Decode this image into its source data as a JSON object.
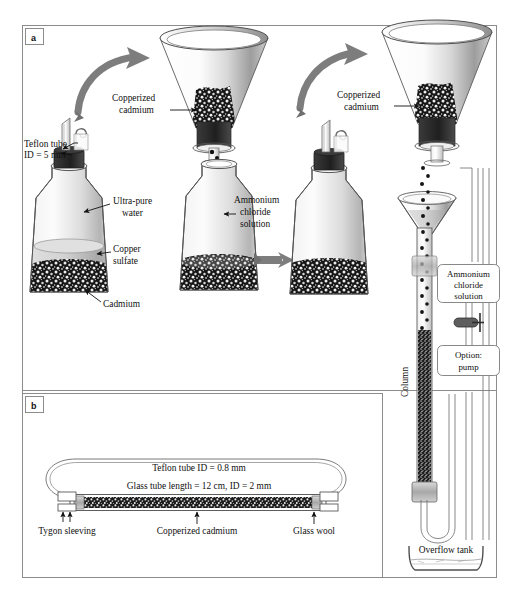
{
  "figure": {
    "title_fragment_top": "",
    "panels": [
      {
        "id": "a",
        "letter": "a"
      },
      {
        "id": "b",
        "letter": "b"
      }
    ]
  },
  "panel_a": {
    "letter": "a",
    "labels": {
      "teflon_tube": "Teflon tube",
      "teflon_tube_id": "ID = 5 mm",
      "copperized_cadmium_left": "Copperized",
      "copperized_cadmium_left2": "cadmium",
      "copperized_cadmium_right": "Copperized",
      "copperized_cadmium_right2": "cadmium",
      "ultra_pure_water": "Ultra-pure",
      "ultra_pure_water2": "water",
      "copper_sulfate": "Copper",
      "copper_sulfate2": "sulfate",
      "cadmium": "Cadmium",
      "ammonium_chloride": "Ammonium",
      "ammonium_chloride2": "chloride",
      "ammonium_chloride3": "solution",
      "column": "Column",
      "overflow_tank": "Overflow tank"
    },
    "callouts": [
      {
        "name": "ammonium-chloride-solution-callout",
        "lines": [
          "Ammonium",
          "chloride",
          "solution"
        ]
      },
      {
        "name": "option-pump-callout",
        "lines": [
          "Option:",
          "pump"
        ]
      }
    ]
  },
  "panel_b": {
    "letter": "b",
    "labels": {
      "teflon_tube_id": "Teflon tube ID = 0.8 mm",
      "glass_tube": "Glass tube length = 12 cm, ID = 2 mm",
      "tygon_sleeving": "Tygon sleeving",
      "copperized_cadmium": "Copperized cadmium",
      "glass_wool": "Glass wool"
    }
  },
  "colors": {
    "frame": "#8c8c8c",
    "ink": "#111111",
    "glass_outline": "#555555",
    "granule_dark": "#1a1a1a",
    "granule_light": "#e8e8e8",
    "liquid": "#c9c9c9",
    "stopper": "#2b2b2b",
    "arrow_gray": "#7d7d7d",
    "callout_stroke": "#7a7a7a",
    "background": "#ffffff"
  }
}
